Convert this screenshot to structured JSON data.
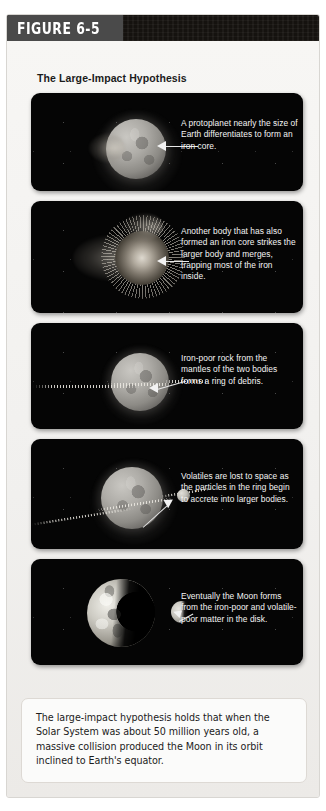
{
  "figure": {
    "tab_label": "FIGURE 6-5",
    "title": "The Large-Impact Hypothesis",
    "summary": "The large-impact hypothesis holds that when the Solar System was about 50 million years old, a massive collision produced the Moon in its orbit inclined to Earth's equator."
  },
  "colors": {
    "page_background": "#ffffff",
    "card_background": "#f2f1ef",
    "header_bar": "#15120f",
    "tab_background": "#4a4a4a",
    "tab_text": "#ffffff",
    "panel_background": "#050505",
    "caption_text": "#f4f4f4",
    "summary_card": "#fbfbfa",
    "summary_text": "#1c1c1c"
  },
  "stages": [
    {
      "id": "stage-1-protoplanet",
      "caption": "A protoplanet nearly the size of Earth differentiates to form an iron core.",
      "scene": "protoplanet-with-iron-core"
    },
    {
      "id": "stage-2-impact",
      "caption": "Another body that has also formed an iron core strikes the larger body and merges, trapping most of the iron inside.",
      "scene": "impact-collision-burst"
    },
    {
      "id": "stage-3-debris-ring",
      "caption": "Iron-poor rock from the mantles of the two bodies forms a ring of debris.",
      "scene": "planet-with-debris-ring"
    },
    {
      "id": "stage-4-accretion",
      "caption": "Volatiles are lost to space as the particles in the ring begin to accrete into larger bodies.",
      "scene": "planet-ring-accreting-moonlet"
    },
    {
      "id": "stage-5-moon-forms",
      "caption": "Eventually the Moon forms from the iron-poor and volatile-poor matter in the disk.",
      "scene": "earth-and-moon"
    }
  ]
}
